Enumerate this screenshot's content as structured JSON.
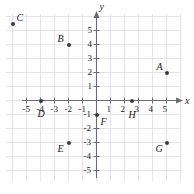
{
  "chart_data": {
    "type": "scatter",
    "title": "",
    "xlabel": "x",
    "ylabel": "y",
    "grid": true,
    "legend": "none",
    "xlim": [
      -6.9,
      6.2
    ],
    "ylim": [
      -6.0,
      6.3
    ],
    "x_ticks": [
      -5,
      -4,
      -3,
      -2,
      -1,
      1,
      2,
      3,
      4,
      5
    ],
    "y_ticks": [
      5,
      4,
      3,
      2,
      1,
      -1,
      -2,
      -3,
      -4,
      -5
    ],
    "x_tick_labels": [
      "-5",
      "-4",
      "-3",
      "-2",
      "-1",
      "1",
      "2",
      "3",
      "4",
      "5"
    ],
    "y_tick_labels": [
      "5",
      "4",
      "3",
      "2",
      "1",
      "-1",
      "-2",
      "-3",
      "-4",
      "-5"
    ],
    "points": [
      {
        "label": "A",
        "x": 5,
        "y": 2,
        "label_dx": -10,
        "label_dy": -11
      },
      {
        "label": "B",
        "x": -2,
        "y": 4,
        "label_dx": -11,
        "label_dy": -11
      },
      {
        "label": "C",
        "x": -6,
        "y": 5.5,
        "label_dx": 4,
        "label_dy": -11
      },
      {
        "label": "D",
        "x": -4,
        "y": 0,
        "label_dx": -3,
        "label_dy": 8
      },
      {
        "label": "E",
        "x": -2,
        "y": -3,
        "label_dx": -11,
        "label_dy": 1
      },
      {
        "label": "F",
        "x": 0,
        "y": -1,
        "label_dx": 4,
        "label_dy": 2
      },
      {
        "label": "H",
        "x": 2.5,
        "y": 0,
        "label_dx": -3,
        "label_dy": 9
      },
      {
        "label": "G",
        "x": 5,
        "y": -3,
        "label_dx": -11,
        "label_dy": 1
      }
    ]
  },
  "colors": {
    "grid": "#dcdce4",
    "axis": "#6a6a72",
    "point": "#3b3b44",
    "text": "#1a1a1a",
    "background": "#ffffff"
  },
  "axis_labels": {
    "x": "x",
    "y": "y"
  }
}
